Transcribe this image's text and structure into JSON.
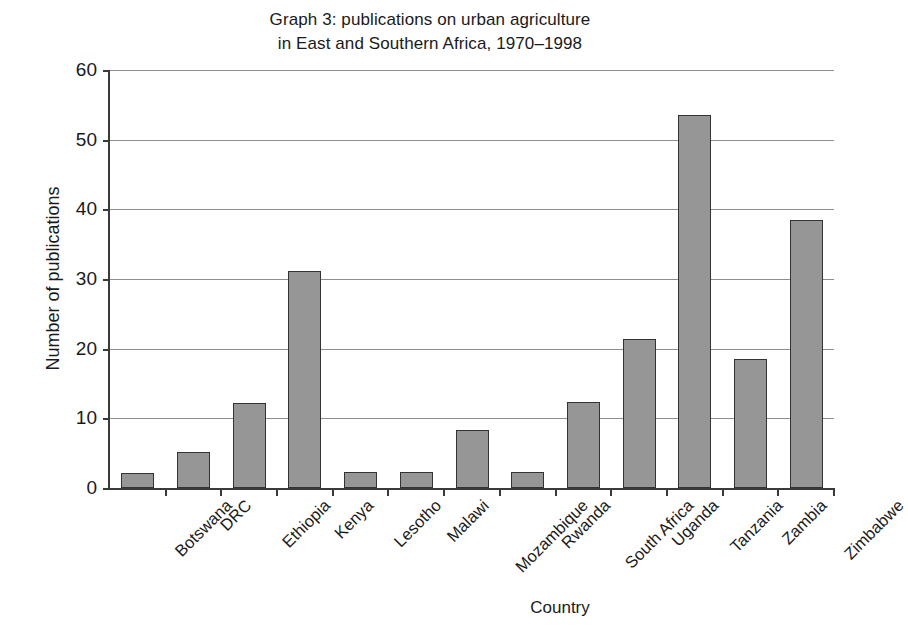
{
  "chart_data": {
    "type": "bar",
    "title": "Graph 3: publications on urban agriculture in East and Southern Africa, 1970–1998",
    "title_lines": [
      "Graph 3: publications on urban agriculture",
      "in East and Southern Africa, 1970–1998"
    ],
    "xlabel": "Country",
    "ylabel": "Number of publications",
    "categories": [
      "Botswana",
      "DRC",
      "Ethiopia",
      "Kenya",
      "Lesotho",
      "Malawi",
      "Mozambique",
      "Rwanda",
      "South Africa",
      "Uganda",
      "Tanzania",
      "Zambia",
      "Zimbabwe"
    ],
    "values": [
      2.1,
      5.1,
      12.2,
      31.2,
      2.3,
      2.3,
      8.3,
      2.3,
      12.3,
      21.4,
      53.6,
      18.5,
      38.5
    ],
    "ylim": [
      0,
      60
    ],
    "yticks": [
      0,
      10,
      20,
      30,
      40,
      50,
      60
    ],
    "ytick_labels": [
      "0",
      "10",
      "20",
      "30",
      "40",
      "50",
      "60"
    ],
    "grid": true,
    "legend": false,
    "bar_color": "#969696",
    "bar_edge_color": "#333333",
    "axis_color": "#3a3a3a",
    "grid_color": "#8e8e8e",
    "background": "#ffffff"
  }
}
